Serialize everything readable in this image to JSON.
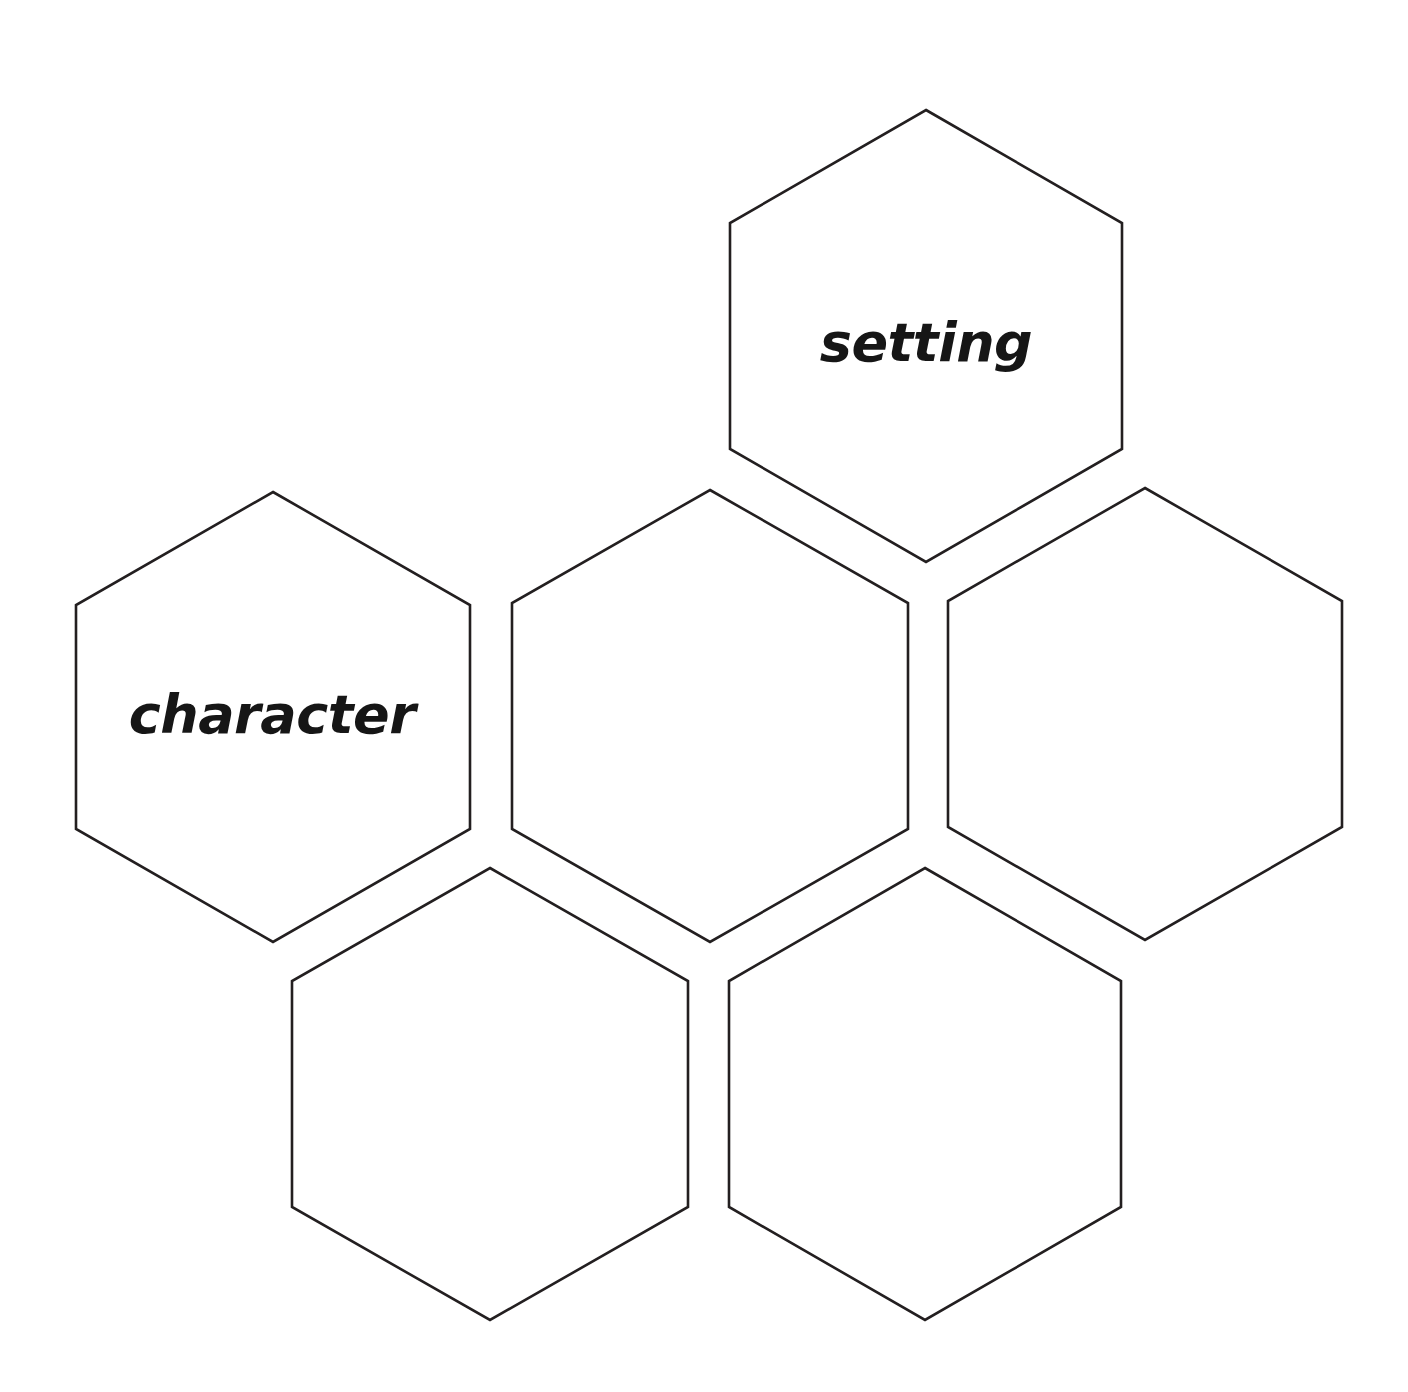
{
  "page": {
    "background_color": "#ffffff",
    "width": 1408,
    "height": 1392
  },
  "style": {
    "outline_color": "#231f20",
    "fill_color": "#ffffff",
    "text_color": "#161616",
    "stroke_width": 2.6
  },
  "hexagons": [
    {
      "id": "setting",
      "label": "setting",
      "has_label": true,
      "center_x": 926,
      "center_y": 336,
      "half_width": 196,
      "half_height": 226,
      "side_height": 113,
      "label_x": 926,
      "label_y": 343,
      "font_size": 54
    },
    {
      "id": "character",
      "label": "character",
      "has_label": true,
      "center_x": 273,
      "center_y": 717,
      "half_width": 197,
      "half_height": 225,
      "side_height": 112,
      "label_x": 272,
      "label_y": 715,
      "font_size": 54
    },
    {
      "id": "middle-blank",
      "label": "",
      "has_label": false,
      "center_x": 710,
      "center_y": 716,
      "half_width": 198,
      "half_height": 226,
      "side_height": 113,
      "label_x": 710,
      "label_y": 716,
      "font_size": 54
    },
    {
      "id": "right-blank",
      "label": "",
      "has_label": false,
      "center_x": 1145,
      "center_y": 714,
      "half_width": 197,
      "half_height": 226,
      "side_height": 113,
      "label_x": 1145,
      "label_y": 714,
      "font_size": 54
    },
    {
      "id": "bottom-left-blank",
      "label": "",
      "has_label": false,
      "center_x": 490,
      "center_y": 1094,
      "half_width": 198,
      "half_height": 226,
      "side_height": 113,
      "label_x": 490,
      "label_y": 1094,
      "font_size": 54
    },
    {
      "id": "bottom-right-blank",
      "label": "",
      "has_label": false,
      "center_x": 925,
      "center_y": 1094,
      "half_width": 196,
      "half_height": 226,
      "side_height": 113,
      "label_x": 925,
      "label_y": 1094,
      "font_size": 54
    }
  ]
}
